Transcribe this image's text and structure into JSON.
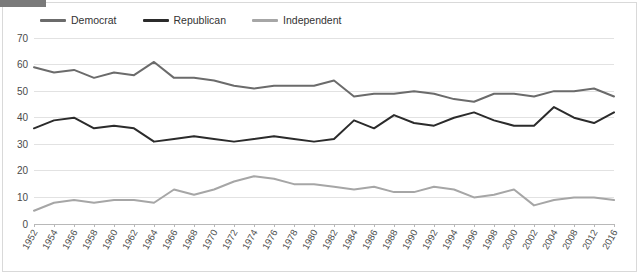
{
  "chart_data": {
    "type": "line",
    "title": "",
    "xlabel": "",
    "ylabel": "",
    "ylim": [
      0,
      70
    ],
    "ytick_values": [
      0,
      10,
      20,
      30,
      40,
      50,
      60,
      70
    ],
    "ytick_labels": [
      "0",
      "10",
      "20",
      "30",
      "40",
      "50",
      "60",
      "70"
    ],
    "grid": "horizontal",
    "legend_position": "top-left",
    "categories": [
      "1952",
      "1954",
      "1956",
      "1958",
      "1960",
      "1962",
      "1964",
      "1966",
      "1968",
      "1970",
      "1972",
      "1974",
      "1976",
      "1978",
      "1980",
      "1982",
      "1984",
      "1986",
      "1988",
      "1990",
      "1992",
      "1994",
      "1996",
      "1998",
      "2000",
      "2002",
      "2004",
      "2008",
      "2012",
      "2016"
    ],
    "series": [
      {
        "name": "Democrat",
        "color": "#6b6b6b",
        "values": [
          59,
          57,
          58,
          55,
          57,
          56,
          61,
          55,
          55,
          54,
          52,
          51,
          52,
          52,
          52,
          54,
          48,
          49,
          49,
          50,
          49,
          47,
          46,
          49,
          49,
          48,
          50,
          50,
          51,
          48
        ]
      },
      {
        "name": "Republican",
        "color": "#2b2b2b",
        "values": [
          36,
          39,
          40,
          36,
          37,
          36,
          31,
          32,
          33,
          32,
          31,
          32,
          33,
          32,
          31,
          32,
          39,
          36,
          41,
          38,
          37,
          40,
          42,
          39,
          37,
          37,
          44,
          40,
          38,
          42
        ]
      },
      {
        "name": "Independent",
        "color": "#a6a6a6",
        "values": [
          5,
          8,
          9,
          8,
          9,
          9,
          8,
          13,
          11,
          13,
          16,
          18,
          17,
          15,
          15,
          14,
          13,
          14,
          12,
          12,
          14,
          13,
          10,
          11,
          13,
          7,
          9,
          10,
          10,
          9
        ]
      }
    ]
  },
  "legend": {
    "items": [
      {
        "label": "Democrat",
        "color": "#6b6b6b"
      },
      {
        "label": "Republican",
        "color": "#2b2b2b"
      },
      {
        "label": "Independent",
        "color": "#a6a6a6"
      }
    ]
  }
}
